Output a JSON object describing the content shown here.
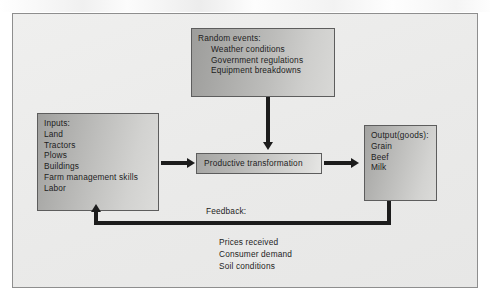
{
  "diagram": {
    "frame_background": "#ececeb",
    "frame_border": "#8e8e8e",
    "text_color": "#1d1d1d",
    "connector_color": "#1c1c1c"
  },
  "random_events": {
    "heading": "Random events:",
    "items": [
      "Weather conditions",
      "Government regulations",
      "Equipment breakdowns"
    ]
  },
  "inputs": {
    "heading": "Inputs:",
    "items": [
      "Land",
      "Tractors",
      "Plows",
      "Buildings",
      "Farm management skills",
      "Labor"
    ]
  },
  "process": {
    "label": "Productive transformation"
  },
  "output": {
    "heading": "Output(goods):",
    "items": [
      "Grain",
      "Beef",
      "Milk"
    ]
  },
  "feedback": {
    "heading": "Feedback:",
    "items": [
      "Prices received",
      "Consumer demand",
      "Soil conditions"
    ]
  },
  "connectors": [
    {
      "name": "inputs-to-process",
      "direction": "right"
    },
    {
      "name": "random-events-to-process",
      "direction": "down"
    },
    {
      "name": "process-to-output",
      "direction": "right"
    },
    {
      "name": "output-to-inputs-feedback",
      "direction": "up"
    }
  ]
}
